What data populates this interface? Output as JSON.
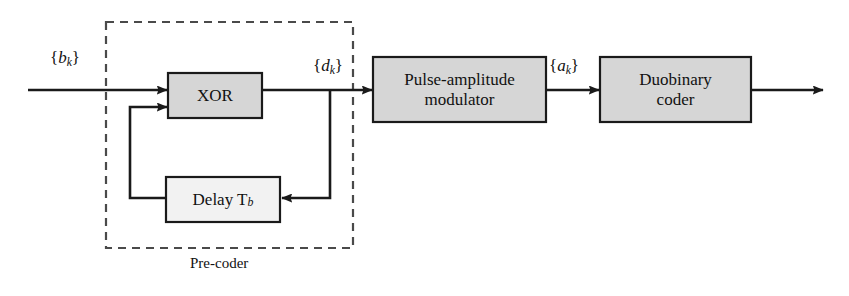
{
  "figure": {
    "type": "block-diagram",
    "background_color": "#ffffff",
    "stroke_color": "#1a1a1a",
    "block_fill_gray": "#d4d4d4",
    "block_fill_light": "#f0f0f0"
  },
  "blocks": {
    "xor": {
      "label": "XOR",
      "x": 168,
      "y": 73,
      "w": 94,
      "h": 45,
      "fill": "#d6d6d6",
      "font_size": 17
    },
    "delay": {
      "label": "Delay T",
      "label_sub": "b",
      "x": 166,
      "y": 177,
      "w": 114,
      "h": 45,
      "fill": "#f2f2f2",
      "font_size": 17
    },
    "pam": {
      "label": "Pulse-amplitude\nmodulator",
      "x": 373,
      "y": 57,
      "w": 173,
      "h": 65,
      "fill": "#d6d6d6",
      "font_size": 17
    },
    "duobinary": {
      "label": "Duobinary\ncoder",
      "x": 600,
      "y": 57,
      "w": 151,
      "h": 65,
      "fill": "#d6d6d6",
      "font_size": 17
    }
  },
  "groups": {
    "precoder": {
      "label": "Pre-coder",
      "x": 106,
      "y": 22,
      "w": 247,
      "h": 226,
      "label_x": 190,
      "label_y": 255,
      "font_size": 15,
      "dash": "7,6"
    }
  },
  "signals": {
    "bk": {
      "open": "{",
      "base": "b",
      "sub": "k",
      "close": "}",
      "x": 50,
      "y": 48,
      "font_size": 17
    },
    "dk": {
      "open": "{",
      "base": "d",
      "sub": "k",
      "close": "}",
      "x": 313,
      "y": 56,
      "font_size": 17
    },
    "ak": {
      "open": "{",
      "base": "a",
      "sub": "k",
      "close": "}",
      "x": 549,
      "y": 56,
      "font_size": 17
    }
  },
  "wires": [
    {
      "name": "input-to-xor",
      "from": "{b_k} source",
      "to": "XOR",
      "y": 90
    },
    {
      "name": "xor-to-pam",
      "from": "XOR",
      "to": "Pulse-amplitude modulator",
      "y": 90
    },
    {
      "name": "dk-feedback-tap",
      "from": "{d_k} line",
      "to": "Delay T_b",
      "y": 198
    },
    {
      "name": "delay-to-xor",
      "from": "Delay T_b",
      "to": "XOR second input",
      "y": 107
    },
    {
      "name": "pam-to-duobinary",
      "from": "Pulse-amplitude modulator",
      "to": "Duobinary coder",
      "y": 90
    },
    {
      "name": "duobinary-output",
      "from": "Duobinary coder",
      "to": "output",
      "y": 90
    }
  ]
}
